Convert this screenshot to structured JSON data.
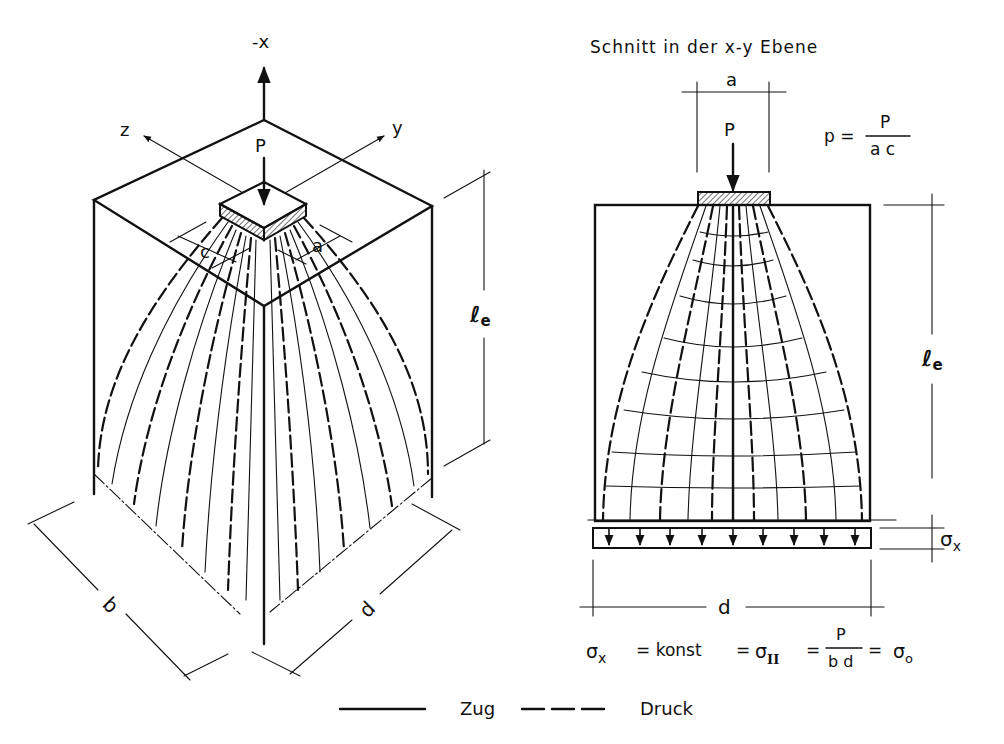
{
  "figure": {
    "left_view": {
      "axis_labels": {
        "neg_x": "-x",
        "y": "y",
        "z": "z"
      },
      "load_label": "P",
      "dim_labels": {
        "a": "a",
        "c": "c",
        "b": "b",
        "d": "d",
        "le": "ℓ",
        "le_sub": "e"
      }
    },
    "right_view": {
      "title": "Schnitt in der x-y Ebene",
      "load_label": "P",
      "dim_labels": {
        "a": "a",
        "le": "ℓ",
        "le_sub": "e",
        "d": "d",
        "sigma_x": "σ",
        "sigma_x_sub": "x"
      },
      "pressure_formula": {
        "lhs": "p =",
        "num": "P",
        "den": "a c"
      },
      "stress_formula": {
        "sigma_x": "σ",
        "sigma_x_sub": "x",
        "eq1": "= konst",
        "eq2": "=",
        "sigma_II": "σ",
        "sigma_II_sub": "II",
        "eq3": "=",
        "num": "P",
        "den": "b d",
        "eq4": "=",
        "sigma_0": "σ",
        "sigma_0_sub": "o"
      }
    },
    "legend": [
      {
        "style": "solid",
        "label": "Zug"
      },
      {
        "style": "dashed",
        "label": "Druck"
      }
    ]
  }
}
